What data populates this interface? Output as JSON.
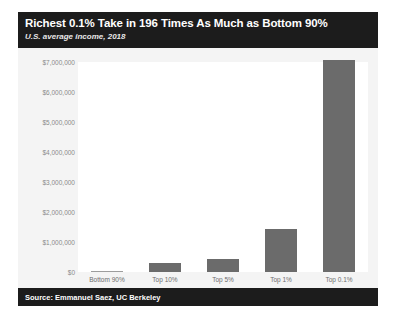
{
  "figure": {
    "title": "Richest 0.1% Take in 196 Times As Much as Bottom 90%",
    "subtitle": "U.S. average income, 2018",
    "source": "Source: Emmanuel Saez, UC Berkeley",
    "colors": {
      "header_band": "#1c1c1c",
      "footer_band": "#1c1c1c",
      "bar": "#6b6b6b",
      "plot_background": "#ffffff",
      "figure_background": "#f2f2f2"
    }
  },
  "chart_data": {
    "type": "bar",
    "title": "Richest 0.1% Take in 196 Times As Much as Bottom 90%",
    "subtitle": "U.S. average income, 2018",
    "xlabel": "",
    "ylabel": "",
    "categories": [
      "Bottom 90%",
      "Top 10%",
      "Top 5%",
      "Top 1%",
      "Top 0.1%"
    ],
    "values": [
      36000,
      290000,
      430000,
      1450000,
      7060000
    ],
    "ylim": [
      0,
      7000000
    ],
    "ytick_values": [
      0,
      1000000,
      2000000,
      3000000,
      4000000,
      5000000,
      6000000,
      7000000
    ],
    "ytick_labels": [
      "$0",
      "$1,000,000",
      "$2,000,000",
      "$3,000,000",
      "$4,000,000",
      "$5,000,000",
      "$6,000,000",
      "$7,000,000"
    ],
    "grid": false,
    "legend": false,
    "bar_color": "#6b6b6b"
  }
}
